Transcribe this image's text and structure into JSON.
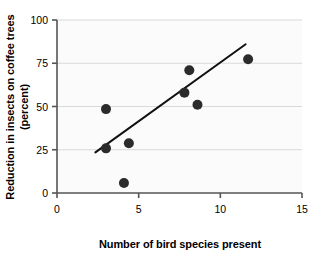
{
  "chart_data": {
    "type": "scatter",
    "title": "",
    "xlabel": "Number of bird species present",
    "ylabel": "Reduction in insects on coffee trees (percent)",
    "ylabel_line1": "Reduction in insects on coffee trees",
    "ylabel_line2": "(percent)",
    "xlim": [
      0,
      15
    ],
    "ylim": [
      0,
      100
    ],
    "xticks": [
      0,
      5,
      10,
      15
    ],
    "xtick_labels": [
      "0",
      "5",
      "10",
      "15"
    ],
    "yticks": [
      0,
      25,
      50,
      75,
      100
    ],
    "ytick_labels": [
      "0",
      "25",
      "50",
      "75",
      "100"
    ],
    "grid": "horizontal",
    "legend": "none",
    "marker": {
      "shape": "circle",
      "color": "#2b2b2b",
      "radius_px": 5
    },
    "points": [
      {
        "x": 3.0,
        "y": 48.5
      },
      {
        "x": 3.0,
        "y": 25.8
      },
      {
        "x": 4.1,
        "y": 5.8
      },
      {
        "x": 4.4,
        "y": 28.8
      },
      {
        "x": 7.8,
        "y": 58.0
      },
      {
        "x": 8.1,
        "y": 71.0
      },
      {
        "x": 8.6,
        "y": 51.0
      },
      {
        "x": 11.7,
        "y": 77.3
      }
    ],
    "trendline": {
      "type": "linear-fit",
      "color": "#111111",
      "width_px": 2,
      "x_start": 2.35,
      "y_start": 23.5,
      "x_end": 11.55,
      "y_end": 86.0
    },
    "plot_background": "#fbfbfb",
    "grid_color": "#d9d9d9",
    "axis_color": "#555555"
  }
}
